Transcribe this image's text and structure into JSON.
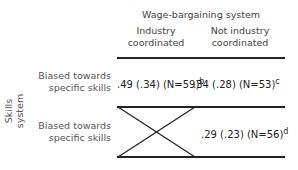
{
  "header": {
    "group_title": "Wage-bargaining system",
    "columns": [
      {
        "line1": "Industry",
        "line2": "coordinated"
      },
      {
        "line1": "Not industry",
        "line2": "coordinated"
      }
    ]
  },
  "axis": {
    "row_group_label": "Skills system"
  },
  "rows": [
    {
      "label_line1": "Biased towards",
      "label_line2": "specific skills",
      "cells": [
        {
          "value": ".49 (.34) (N=59)",
          "note": "b"
        },
        {
          "value": ".34 (.28) (N=53)",
          "note": "c"
        }
      ]
    },
    {
      "label_line1": "Biased towards",
      "label_line2": "specific skills",
      "cells": [
        {
          "value": "",
          "note": "",
          "empty_cell_marker": "crossed-out"
        },
        {
          "value": ".29 (.23) (N=56)",
          "note": "d"
        }
      ]
    }
  ],
  "colors": {
    "lines": "#222222",
    "text": "#333333"
  }
}
